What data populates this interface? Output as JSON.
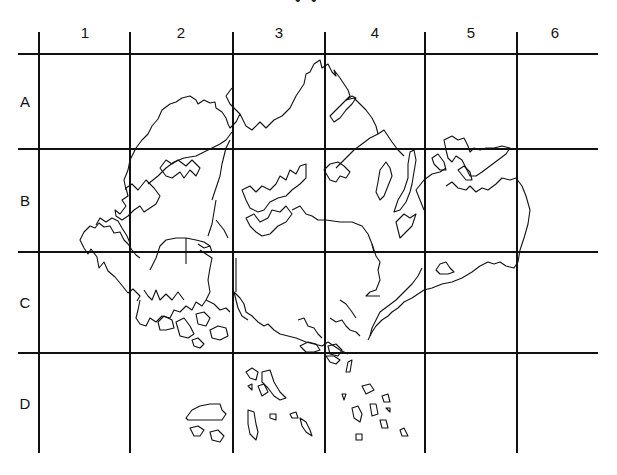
{
  "map": {
    "title_fragment": "• •",
    "columns": [
      {
        "label": "1",
        "x": 85
      },
      {
        "label": "2",
        "x": 181
      },
      {
        "label": "3",
        "x": 279
      },
      {
        "label": "4",
        "x": 375
      },
      {
        "label": "5",
        "x": 471
      },
      {
        "label": "6",
        "x": 555
      }
    ],
    "rows": [
      {
        "label": "A",
        "y": 101
      },
      {
        "label": "B",
        "y": 200
      },
      {
        "label": "C",
        "y": 302
      },
      {
        "label": "D",
        "y": 403
      }
    ],
    "grid": {
      "vertical_x": [
        39,
        130,
        233,
        325,
        425,
        517
      ],
      "vertical_y_range": [
        32,
        453
      ],
      "horizontal_y": [
        54,
        149,
        252,
        353
      ],
      "horizontal_x_range": [
        18,
        598
      ],
      "line_color": "#111111"
    },
    "coastline_color": "#111111"
  }
}
